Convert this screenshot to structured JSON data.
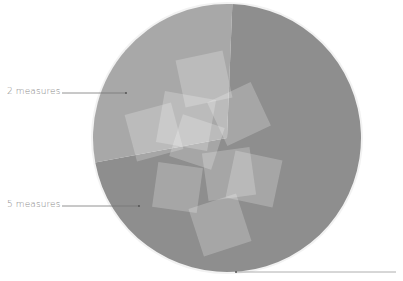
{
  "chart_data": {
    "type": "pie",
    "title": "",
    "categories": [
      "2 measures",
      "5 measures"
    ],
    "values": [
      2,
      5
    ],
    "colors": [
      "#a8a8a8",
      "#8e8e8e"
    ],
    "annotations": [
      {
        "text": "2 measures",
        "target": "light-sector"
      },
      {
        "text": "5 measures",
        "target": "dark-sector"
      }
    ],
    "legend": "none",
    "grid": false
  },
  "labels": {
    "two": "2 measures",
    "five": "5 measures"
  },
  "geometry": {
    "cx": 227,
    "cy": 138,
    "r": 134
  },
  "squares": [
    {
      "x": 180,
      "y": 55,
      "s": 48,
      "rot": -12
    },
    {
      "x": 160,
      "y": 95,
      "s": 52,
      "rot": 10
    },
    {
      "x": 130,
      "y": 108,
      "s": 48,
      "rot": -15
    },
    {
      "x": 215,
      "y": 90,
      "s": 48,
      "rot": -25
    },
    {
      "x": 175,
      "y": 120,
      "s": 44,
      "rot": 18
    },
    {
      "x": 155,
      "y": 165,
      "s": 45,
      "rot": 8
    },
    {
      "x": 205,
      "y": 150,
      "s": 48,
      "rot": -8
    },
    {
      "x": 230,
      "y": 155,
      "s": 48,
      "rot": 12
    },
    {
      "x": 195,
      "y": 200,
      "s": 50,
      "rot": -18
    }
  ]
}
